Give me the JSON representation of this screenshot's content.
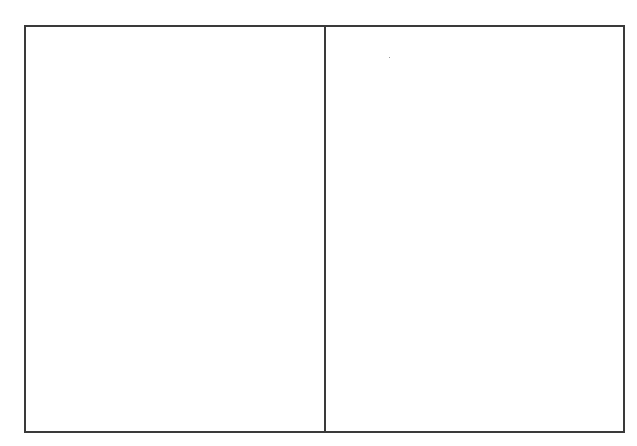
{
  "diagram": {
    "type": "two-panel-frame",
    "panels": [
      {
        "id": "left",
        "label": ""
      },
      {
        "id": "right",
        "label": ""
      }
    ],
    "colors": {
      "background": "#ffffff",
      "stroke": "#3a3a3a"
    }
  }
}
